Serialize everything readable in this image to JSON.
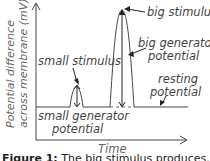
{
  "diagram": {
    "axes": {
      "y_label_line1": "Potential difference",
      "y_label_line2": "across membrane (mV)",
      "x_label": "Time"
    },
    "annotations": {
      "big_stimulus": "big stimulus",
      "big_generator_line1": "big generator",
      "big_generator_line2": "potential",
      "resting_line1": "resting",
      "resting_line2": "potential",
      "small_stimulus": "small stimulus",
      "small_generator_line1": "small generator",
      "small_generator_line2": "potential"
    },
    "caption": {
      "prefix": "Figure 1:",
      "text": "The big stimulus produces..."
    },
    "colors": {
      "line": "#333333",
      "text": "#444444",
      "axis_label": "#666666"
    }
  }
}
